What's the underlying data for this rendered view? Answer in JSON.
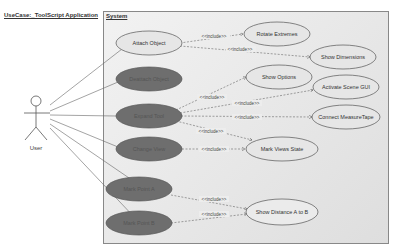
{
  "diagram": {
    "title": "UseCase:_ToolScript Application",
    "system_label": "System",
    "actor": {
      "label": "User"
    },
    "include_label": "<<include>>",
    "colors": {
      "light_fill": "#e6e6e6",
      "dark_fill": "#6e6e6e",
      "stroke": "#555555",
      "frame": "#e4e4e4"
    },
    "use_cases": [
      {
        "id": "attach",
        "label": "Attach Object",
        "style": "light"
      },
      {
        "id": "deattach",
        "label": "Deattach Object",
        "style": "dark"
      },
      {
        "id": "expand",
        "label": "Expand Tool",
        "style": "dark"
      },
      {
        "id": "change",
        "label": "Change View",
        "style": "dark"
      },
      {
        "id": "markA",
        "label": "Mark Point A",
        "style": "dark"
      },
      {
        "id": "markB",
        "label": "Mark Point B",
        "style": "dark"
      },
      {
        "id": "rotate",
        "label": "Rotate Extremes",
        "style": "light"
      },
      {
        "id": "showdim",
        "label": "Show Dimensions",
        "style": "light"
      },
      {
        "id": "showopt",
        "label": "Show Options",
        "style": "light"
      },
      {
        "id": "activate",
        "label": "Activate Scene GUI",
        "style": "light"
      },
      {
        "id": "connect",
        "label": "Connect MeasureTape",
        "style": "light"
      },
      {
        "id": "markviews",
        "label": "Mark Views State",
        "style": "light"
      },
      {
        "id": "showdist",
        "label": "Show Distance A to B",
        "style": "light"
      }
    ],
    "includes": [
      {
        "from": "attach",
        "to": "rotate"
      },
      {
        "from": "attach",
        "to": "showdim"
      },
      {
        "from": "expand",
        "to": "showopt"
      },
      {
        "from": "expand",
        "to": "activate"
      },
      {
        "from": "expand",
        "to": "connect"
      },
      {
        "from": "expand",
        "to": "markviews"
      },
      {
        "from": "change",
        "to": "markviews"
      },
      {
        "from": "markA",
        "to": "showdist"
      },
      {
        "from": "markB",
        "to": "showdist"
      }
    ]
  }
}
